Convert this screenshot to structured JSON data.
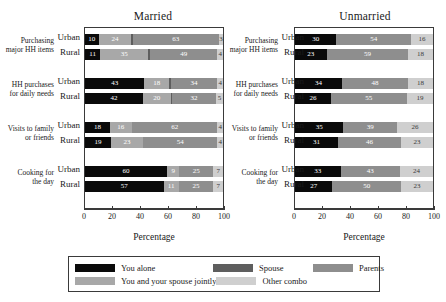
{
  "axis": {
    "title": "Percentage",
    "ticks": [
      0,
      20,
      40,
      60,
      80,
      100
    ],
    "tick_labels": [
      "0",
      "20",
      "40",
      "60",
      "80",
      "100"
    ]
  },
  "row_labels": {
    "urban": "Urban",
    "rural": "Rural"
  },
  "legend": {
    "items": [
      {
        "label": "You alone",
        "color": "#0a0a0a",
        "key": "you_alone"
      },
      {
        "label": "You and your spouse jointly",
        "color": "#a8a8a8",
        "key": "jointly"
      },
      {
        "label": "Spouse",
        "color": "#5e5e5e",
        "key": "spouse"
      },
      {
        "label": "Other combo",
        "color": "#cfcfcf",
        "key": "other_combo"
      },
      {
        "label": "Parents",
        "color": "#8e8e8e",
        "key": "parents"
      }
    ]
  },
  "panels": {
    "married": {
      "title": "Married"
    },
    "unmarried": {
      "title": "Unmarried"
    }
  },
  "categories": [
    {
      "line1": "Purchasing",
      "line2": "major HH items"
    },
    {
      "line1": "HH purchases",
      "line2": "for daily needs"
    },
    {
      "line1": "Visits to family",
      "line2": "or friends"
    },
    {
      "line1": "Cooking for",
      "line2": "the day"
    }
  ],
  "chart_data": {
    "type": "bar",
    "orientation": "horizontal",
    "stacked": true,
    "title": "",
    "xlabel": "Percentage",
    "ylabel": "",
    "xlim": [
      0,
      100
    ],
    "grid": false,
    "legend_position": "bottom",
    "panels": [
      {
        "name": "Married",
        "series": [
          {
            "name": "You alone",
            "color": "#0a0a0a"
          },
          {
            "name": "You and your spouse jointly",
            "color": "#a8a8a8"
          },
          {
            "name": "Spouse",
            "color": "#5e5e5e"
          },
          {
            "name": "Parents",
            "color": "#8e8e8e"
          },
          {
            "name": "Other combo",
            "color": "#cfcfcf"
          }
        ],
        "groups": [
          {
            "category": "Purchasing major HH items",
            "rows": [
              {
                "name": "Urban",
                "values": [
                  10,
                  24,
                  1,
                  63,
                  3
                ]
              },
              {
                "name": "Rural",
                "values": [
                  11,
                  35,
                  1,
                  49,
                  4
                ]
              }
            ]
          },
          {
            "category": "HH purchases for daily needs",
            "rows": [
              {
                "name": "Urban",
                "values": [
                  43,
                  18,
                  1,
                  34,
                  4
                ]
              },
              {
                "name": "Rural",
                "values": [
                  42,
                  20,
                  1,
                  32,
                  5
                ]
              }
            ]
          },
          {
            "category": "Visits to family or friends",
            "rows": [
              {
                "name": "Urban",
                "values": [
                  18,
                  16,
                  0,
                  62,
                  4
                ]
              },
              {
                "name": "Rural",
                "values": [
                  19,
                  23,
                  0,
                  54,
                  4
                ]
              }
            ]
          },
          {
            "category": "Cooking for the day",
            "rows": [
              {
                "name": "Urban",
                "values": [
                  60,
                  9,
                  0,
                  25,
                  7
                ]
              },
              {
                "name": "Rural",
                "values": [
                  57,
                  11,
                  0,
                  25,
                  7
                ]
              }
            ]
          }
        ]
      },
      {
        "name": "Unmarried",
        "series": [
          {
            "name": "You alone",
            "color": "#0a0a0a"
          },
          {
            "name": "Parents",
            "color": "#8e8e8e"
          },
          {
            "name": "Other combo",
            "color": "#cfcfcf"
          }
        ],
        "groups": [
          {
            "category": "Purchasing major HH items",
            "rows": [
              {
                "name": "Urban",
                "values": [
                  30,
                  54,
                  16
                ]
              },
              {
                "name": "Rural",
                "values": [
                  23,
                  59,
                  18
                ]
              }
            ]
          },
          {
            "category": "HH purchases for daily needs",
            "rows": [
              {
                "name": "Urban",
                "values": [
                  34,
                  48,
                  18
                ]
              },
              {
                "name": "Rural",
                "values": [
                  26,
                  55,
                  19
                ]
              }
            ]
          },
          {
            "category": "Visits to family or friends",
            "rows": [
              {
                "name": "Urban",
                "values": [
                  35,
                  39,
                  26
                ]
              },
              {
                "name": "Rural",
                "values": [
                  31,
                  46,
                  23
                ]
              }
            ]
          },
          {
            "category": "Cooking for the day",
            "rows": [
              {
                "name": "Urban",
                "values": [
                  33,
                  43,
                  24
                ]
              },
              {
                "name": "Rural",
                "values": [
                  27,
                  50,
                  23
                ]
              }
            ]
          }
        ]
      }
    ]
  }
}
